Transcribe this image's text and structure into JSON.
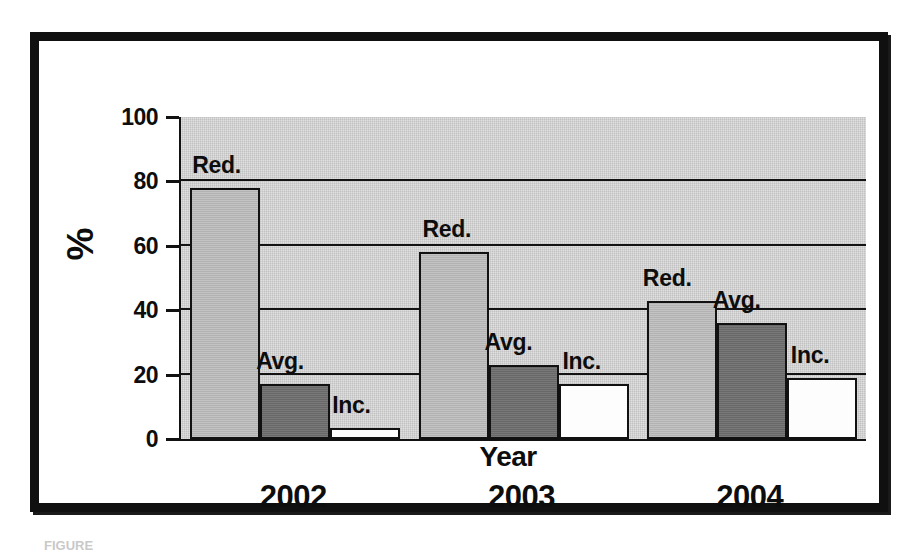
{
  "figure": {
    "caption": "FIGURE",
    "frame_color": "#101010",
    "background_color": "#ffffff"
  },
  "chart_data": {
    "type": "bar",
    "title": "",
    "xlabel": "Year",
    "ylabel": "%",
    "categories": [
      "2002",
      "2003",
      "2004"
    ],
    "ylim": [
      0,
      100
    ],
    "yticks": [
      0,
      20,
      40,
      60,
      80,
      100
    ],
    "ytick_labels": [
      "0",
      "20",
      "40",
      "60",
      "80",
      "100"
    ],
    "grid": true,
    "grid_axis": "y",
    "legend": "inline-labels",
    "plot_background": "#d6d6d6",
    "series": [
      {
        "name": "Red.",
        "label": "Red.",
        "color": "#bcbcbc",
        "values": [
          78,
          58,
          43
        ]
      },
      {
        "name": "Avg.",
        "label": "Avg.",
        "color": "#6e6e6e",
        "values": [
          17,
          23,
          36
        ]
      },
      {
        "name": "Inc.",
        "label": "Inc.",
        "color": "#fdfdfd",
        "values": [
          3.5,
          17,
          19
        ]
      }
    ],
    "bar_annotations": [
      {
        "text": "Red.",
        "group": "2002",
        "series": "Red."
      },
      {
        "text": "Avg.",
        "group": "2002",
        "series": "Avg."
      },
      {
        "text": "Inc.",
        "group": "2002",
        "series": "Inc."
      },
      {
        "text": "Red.",
        "group": "2003",
        "series": "Red."
      },
      {
        "text": "Avg.",
        "group": "2003",
        "series": "Avg."
      },
      {
        "text": "Inc.",
        "group": "2003",
        "series": "Inc."
      },
      {
        "text": "Red.",
        "group": "2004",
        "series": "Red."
      },
      {
        "text": "Avg.",
        "group": "2004",
        "series": "Avg."
      },
      {
        "text": "Inc.",
        "group": "2004",
        "series": "Inc."
      }
    ]
  }
}
